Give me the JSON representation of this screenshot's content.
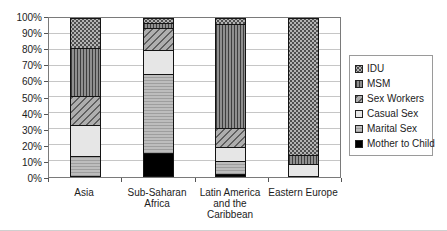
{
  "chart_data": {
    "type": "bar",
    "variant": "100-percent-stacked",
    "title": "",
    "xlabel": "",
    "ylabel": "",
    "grid": true,
    "legend_position": "right",
    "categories": [
      "Asia",
      "Sub-Saharan Africa",
      "Latin America and the Caribbean",
      "Eastern Europe"
    ],
    "category_label_lines": [
      [
        "Asia"
      ],
      [
        "Sub-Saharan",
        "Africa"
      ],
      [
        "Latin America",
        "and the",
        "Caribbean"
      ],
      [
        "Eastern Europe"
      ]
    ],
    "series_bottom_to_top": [
      {
        "name": "Mother to Child",
        "pattern": "solid-black",
        "color": "#000000",
        "values": [
          0,
          15,
          2,
          0
        ]
      },
      {
        "name": "Marital Sex",
        "pattern": "hlines",
        "color": "#b8b8b8",
        "values": [
          13,
          50,
          8,
          0
        ]
      },
      {
        "name": "Casual Sex",
        "pattern": "light",
        "color": "#e6e6e6",
        "values": [
          20,
          15,
          9,
          8
        ]
      },
      {
        "name": "Sex Workers",
        "pattern": "diag",
        "color": "#a8a8a8",
        "values": [
          18,
          14,
          12,
          0
        ]
      },
      {
        "name": "MSM",
        "pattern": "vert",
        "color": "#8f8f8f",
        "values": [
          30,
          3,
          65,
          6
        ]
      },
      {
        "name": "IDU",
        "pattern": "dots",
        "color": "#b4b4b4",
        "values": [
          19,
          3,
          4,
          86
        ]
      }
    ],
    "legend": [
      "IDU",
      "MSM",
      "Sex Workers",
      "Casual Sex",
      "Marital Sex",
      "Mother to Child"
    ],
    "y_axis": {
      "min": 0,
      "max": 100,
      "step": 10,
      "tick_labels_top_to_bottom": [
        "100%",
        "90%",
        "80%",
        "70%",
        "60%",
        "50%",
        "40%",
        "30%",
        "20%",
        "10%",
        "0%"
      ]
    },
    "colors": {
      "background": "#ffffff",
      "gridline": "#c6c6c6",
      "plot_border": "#7a7a7a",
      "bar_border": "#141414",
      "legend_border": "#9a9a9a",
      "text": "#1c1c1c"
    }
  }
}
